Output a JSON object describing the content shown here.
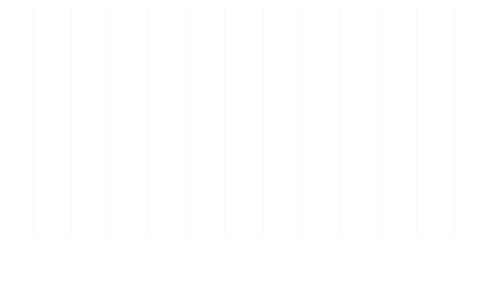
{
  "chart_data": {
    "type": "line",
    "title": "",
    "xlabel": "",
    "ylabel": "",
    "categories": [
      "1956\n~\n1960",
      "1961\n~\n1965",
      "1966\n~\n1970",
      "1971\n~\n1975",
      "1976\n~\n1980",
      "1981\n~\n1985",
      "1986\n~\n1990",
      "1991\n~\n1995",
      "1996\n~\n2000",
      "2001\n~\n2005",
      "2006\n~\n2010",
      "2011\n~\n2015"
    ],
    "category_parts": [
      {
        "start": "1956",
        "sep": "~",
        "end": "1960"
      },
      {
        "start": "1961",
        "sep": "~",
        "end": "1965"
      },
      {
        "start": "1966",
        "sep": "~",
        "end": "1970"
      },
      {
        "start": "1971",
        "sep": "~",
        "end": "1975"
      },
      {
        "start": "1976",
        "sep": "~",
        "end": "1980"
      },
      {
        "start": "1981",
        "sep": "~",
        "end": "1985"
      },
      {
        "start": "1986",
        "sep": "~",
        "end": "1990"
      },
      {
        "start": "1991",
        "sep": "~",
        "end": "1995"
      },
      {
        "start": "1996",
        "sep": "~",
        "end": "2000"
      },
      {
        "start": "2001",
        "sep": "~",
        "end": "2005"
      },
      {
        "start": "2006",
        "sep": "~",
        "end": "2010"
      },
      {
        "start": "2011",
        "sep": "~",
        "end": "2015"
      }
    ],
    "values": [
      1,
      0,
      0,
      1,
      1,
      8,
      10,
      16,
      14,
      20,
      3,
      2
    ],
    "point_labels": [
      "1",
      "0",
      "0",
      "1",
      "1",
      "8",
      "10",
      "16",
      "14",
      "20",
      "3",
      "2"
    ],
    "ylim": [
      0,
      20
    ],
    "grid": "vertical-dotted",
    "legend": "none",
    "markers": "first-and-last",
    "colors": {
      "line": "#a0a0a2",
      "marker": "#9a9a9c",
      "grid": "#e8e8ea",
      "label": "#4a4a4a",
      "tick": "#3c3c3c",
      "background": "#ffffff"
    }
  }
}
